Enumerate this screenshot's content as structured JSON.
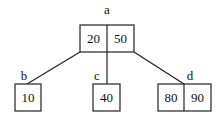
{
  "diagram": {
    "type": "B-tree",
    "nodes": {
      "a": {
        "label": "a",
        "keys": [
          "20",
          "50"
        ]
      },
      "b": {
        "label": "b",
        "keys": [
          "10"
        ]
      },
      "c": {
        "label": "c",
        "keys": [
          "40"
        ]
      },
      "d": {
        "label": "d",
        "keys": [
          "80",
          "90"
        ]
      }
    },
    "edges": [
      {
        "from": "a",
        "to": "b"
      },
      {
        "from": "a",
        "to": "c"
      },
      {
        "from": "a",
        "to": "d"
      }
    ],
    "colors": {
      "stroke": "#222222",
      "background": "#ffffff"
    }
  }
}
